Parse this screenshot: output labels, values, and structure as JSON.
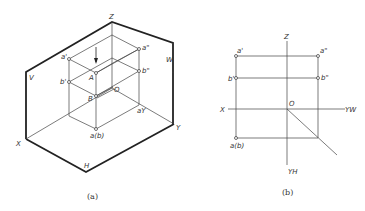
{
  "figure_a": {
    "caption": "(a)",
    "plane_labels": {
      "V": "V",
      "W": "W",
      "H": "H"
    },
    "axis_labels": {
      "X": "X",
      "Y": "Y",
      "Z": "Z"
    },
    "point_labels": {
      "a_front": "a'",
      "a_side": "a\"",
      "b_front": "b'",
      "b_side": "b\"",
      "A": "A",
      "B": "B",
      "O": "O",
      "a_y": "aY",
      "a_top": "a(b)"
    }
  },
  "figure_b": {
    "caption": "(b)",
    "axis_labels": {
      "X": "X",
      "Z": "Z",
      "O": "O",
      "YW": "YW",
      "YH": "YH"
    },
    "point_labels": {
      "a_front": "a'",
      "a_side": "a\"",
      "b_front": "b'",
      "b_side": "b\"",
      "a_top": "a(b)"
    }
  }
}
